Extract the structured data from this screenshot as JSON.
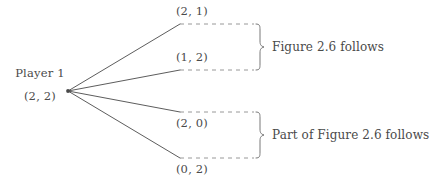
{
  "figure": {
    "type": "extensive-form-game-tree",
    "background_color": "#ffffff",
    "ink_color": "#4a4a4a",
    "decision_node": {
      "player_label": "Player 1",
      "payoff_label": "(2, 2)",
      "x": 68,
      "y": 91
    },
    "branches": [
      {
        "id": "branch-1",
        "payoff_label": "(2, 1)",
        "label_position": "above",
        "end_x": 180,
        "end_y": 24,
        "dash_end_x": 254
      },
      {
        "id": "branch-2",
        "payoff_label": "(1, 2)",
        "label_position": "above",
        "end_x": 180,
        "end_y": 70,
        "dash_end_x": 254
      },
      {
        "id": "branch-3",
        "payoff_label": "(2, 0)",
        "label_position": "below",
        "end_x": 180,
        "end_y": 112,
        "dash_end_x": 254
      },
      {
        "id": "branch-4",
        "payoff_label": "(0, 2)",
        "label_position": "below",
        "end_x": 180,
        "end_y": 158,
        "dash_end_x": 254
      }
    ],
    "groups": [
      {
        "id": "group-top",
        "annotation": "Figure 2.6 follows",
        "brace_top_y": 24,
        "brace_bottom_y": 70,
        "text_x": 272,
        "text_y": 47
      },
      {
        "id": "group-bottom",
        "annotation": "Part of Figure 2.6 follows",
        "brace_top_y": 112,
        "brace_bottom_y": 158,
        "text_x": 272,
        "text_y": 135
      }
    ]
  }
}
